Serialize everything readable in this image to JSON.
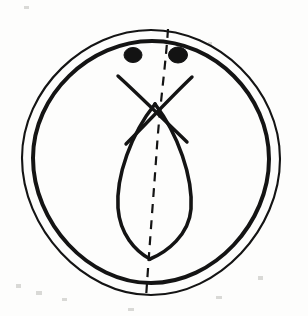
{
  "figure": {
    "description": "Ink line drawing of a rounded cell with a double outer membrane, two dark centriole dots near the top, crossing spindle fibers forming an X, a central lens-shaped spindle body, and a dashed curved cleavage line running top to bottom.",
    "background_color": "#fdfdfc",
    "ink_color": "#141414"
  },
  "geometry": {
    "canvas": {
      "width": 308,
      "height": 316
    },
    "center": {
      "x": 151,
      "y": 159
    },
    "membrane_outer_radius": 129,
    "membrane_inner_radius": 118
  },
  "parts": [
    {
      "id": "membrane-outer",
      "label": "Outer cell membrane",
      "stroke_width": 2.1
    },
    {
      "id": "membrane-inner",
      "label": "Inner cell membrane",
      "stroke_width": 4.0
    },
    {
      "id": "centriole-left",
      "label": "Left centriole",
      "cx": 133,
      "cy": 55,
      "rx": 9,
      "ry": 7.5
    },
    {
      "id": "centriole-right",
      "label": "Right centriole",
      "cx": 178,
      "cy": 55,
      "rx": 9.5,
      "ry": 8
    },
    {
      "id": "spindle-fiber-left",
      "label": "Left spindle fiber",
      "from": {
        "x": 118,
        "y": 76
      },
      "to": {
        "x": 186,
        "y": 141
      }
    },
    {
      "id": "spindle-fiber-right",
      "label": "Right spindle fiber",
      "from": {
        "x": 192,
        "y": 77
      },
      "to": {
        "x": 127,
        "y": 143
      }
    },
    {
      "id": "spindle-body",
      "label": "Lens-shaped spindle body",
      "top": {
        "x": 155,
        "y": 104
      },
      "bottom": {
        "x": 150,
        "y": 259
      },
      "left_x": 116,
      "right_x": 193
    },
    {
      "id": "cleavage-line",
      "label": "Dashed cleavage plane",
      "from": {
        "x": 168,
        "y": 29
      },
      "to": {
        "x": 146,
        "y": 298
      }
    }
  ],
  "paths": {
    "membrane_outer": "M 151 30 C 218 30 280 89 280 159 C 280 229 219 295 151 295 C 83 295 22 228 22 158 C 22 89 85 30 151 30 Z",
    "membrane_inner": "M 152 41 C 214 41 269 95 269 159 C 269 223 214 283 151 283 C 88 283 33 222 33 158 C 33 95 90 41 152 41 Z",
    "fiber_left": "M 118 76 C 139 95 166 122 187 142",
    "fiber_right": "M 192 77 C 172 96 147 123 126 144",
    "lens_left": "M 155 104 C 131 134 116 176 118 208 C 120 234 135 251 150 259",
    "lens_right": "M 155 104 C 178 134 193 177 191 209 C 189 235 167 252 150 259",
    "cleavage": "M 168 29 C 166 62 160 104 157 146 C 154 190 150 238 146 298"
  },
  "specks": [
    {
      "x": 16,
      "y": 284,
      "w": 5,
      "h": 4
    },
    {
      "x": 36,
      "y": 291,
      "w": 6,
      "h": 4
    },
    {
      "x": 62,
      "y": 298,
      "w": 5,
      "h": 3
    },
    {
      "x": 128,
      "y": 308,
      "w": 6,
      "h": 3
    },
    {
      "x": 216,
      "y": 296,
      "w": 6,
      "h": 3
    },
    {
      "x": 258,
      "y": 276,
      "w": 5,
      "h": 4
    },
    {
      "x": 24,
      "y": 6,
      "w": 5,
      "h": 3
    },
    {
      "x": 208,
      "y": 42,
      "w": 4,
      "h": 3
    }
  ]
}
